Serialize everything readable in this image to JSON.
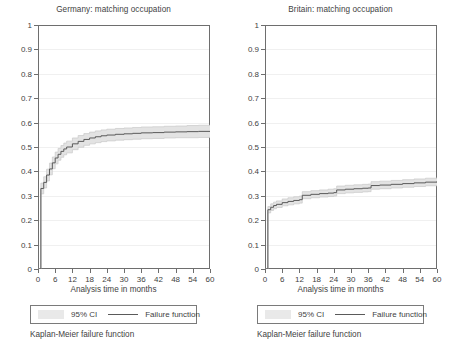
{
  "figure": {
    "panels": [
      {
        "title": "Germany: matching occupation",
        "xlabel": "Analysis time in months",
        "legend": {
          "ci_label": "95% CI",
          "line_label": "Failure function"
        },
        "note": "Kaplan-Meier failure function"
      },
      {
        "title": "Britain: matching occupation",
        "xlabel": "Analysis time in months",
        "legend": {
          "ci_label": "95% CI",
          "line_label": "Failure function"
        },
        "note": "Kaplan-Meier failure function"
      }
    ],
    "yticks": [
      "0",
      "0.1",
      "0.2",
      "0.3",
      "0.4",
      "0.5",
      "0.6",
      "0.7",
      "0.8",
      "0.9",
      "1"
    ],
    "xticks": [
      "0",
      "6",
      "12",
      "18",
      "24",
      "30",
      "36",
      "42",
      "48",
      "54",
      "60"
    ],
    "colors": {
      "line": "#5a5a5a",
      "ci_band": "#e3e3e3",
      "frame": "#6e6e6e",
      "grid": "#f0f0f0",
      "text": "#3f3f3f",
      "background": "#ffffff"
    }
  },
  "chart_data": [
    {
      "type": "line",
      "title": "Germany: matching occupation",
      "subtitle": "Kaplan-Meier failure function",
      "xlabel": "Analysis time in months",
      "ylabel": "",
      "xlim": [
        0,
        60
      ],
      "ylim": [
        0,
        1
      ],
      "xticks": [
        0,
        6,
        12,
        18,
        24,
        30,
        36,
        42,
        48,
        54,
        60
      ],
      "yticks": [
        0,
        0.1,
        0.2,
        0.3,
        0.4,
        0.5,
        0.6,
        0.7,
        0.8,
        0.9,
        1
      ],
      "grid": true,
      "legend": [
        "95% CI",
        "Failure function"
      ],
      "legend_position": "below-axes",
      "series": [
        {
          "name": "Failure function",
          "x": [
            0,
            1,
            1,
            2,
            3,
            4,
            5,
            6,
            7,
            8,
            9,
            10,
            12,
            14,
            16,
            18,
            20,
            22,
            24,
            27,
            30,
            33,
            36,
            40,
            44,
            48,
            52,
            56,
            60
          ],
          "values": [
            0,
            0,
            0.33,
            0.355,
            0.385,
            0.41,
            0.435,
            0.455,
            0.47,
            0.482,
            0.492,
            0.5,
            0.513,
            0.523,
            0.531,
            0.537,
            0.542,
            0.546,
            0.549,
            0.552,
            0.554,
            0.556,
            0.558,
            0.559,
            0.561,
            0.562,
            0.563,
            0.564,
            0.565
          ]
        },
        {
          "name": "95% CI upper",
          "x": [
            0,
            1,
            1,
            2,
            3,
            4,
            5,
            6,
            7,
            8,
            9,
            10,
            12,
            14,
            16,
            18,
            20,
            22,
            24,
            27,
            30,
            33,
            36,
            40,
            44,
            48,
            52,
            56,
            60
          ],
          "values": [
            0,
            0,
            0.352,
            0.378,
            0.409,
            0.434,
            0.459,
            0.479,
            0.494,
            0.506,
            0.516,
            0.524,
            0.537,
            0.547,
            0.555,
            0.561,
            0.566,
            0.57,
            0.573,
            0.576,
            0.578,
            0.58,
            0.582,
            0.583,
            0.585,
            0.586,
            0.588,
            0.589,
            0.59
          ]
        },
        {
          "name": "95% CI lower",
          "x": [
            0,
            1,
            1,
            2,
            3,
            4,
            5,
            6,
            7,
            8,
            9,
            10,
            12,
            14,
            16,
            18,
            20,
            22,
            24,
            27,
            30,
            33,
            36,
            40,
            44,
            48,
            52,
            56,
            60
          ],
          "values": [
            0,
            0,
            0.308,
            0.332,
            0.361,
            0.386,
            0.411,
            0.431,
            0.446,
            0.458,
            0.468,
            0.476,
            0.489,
            0.499,
            0.507,
            0.513,
            0.518,
            0.522,
            0.525,
            0.528,
            0.53,
            0.532,
            0.534,
            0.535,
            0.537,
            0.538,
            0.538,
            0.539,
            0.54
          ]
        }
      ]
    },
    {
      "type": "line",
      "title": "Britain: matching occupation",
      "subtitle": "Kaplan-Meier failure function",
      "xlabel": "Analysis time in months",
      "ylabel": "",
      "xlim": [
        0,
        60
      ],
      "ylim": [
        0,
        1
      ],
      "xticks": [
        0,
        6,
        12,
        18,
        24,
        30,
        36,
        42,
        48,
        54,
        60
      ],
      "yticks": [
        0,
        0.1,
        0.2,
        0.3,
        0.4,
        0.5,
        0.6,
        0.7,
        0.8,
        0.9,
        1
      ],
      "grid": true,
      "legend": [
        "95% CI",
        "Failure function"
      ],
      "legend_position": "below-axes",
      "series": [
        {
          "name": "Failure function",
          "x": [
            0,
            1,
            1,
            2,
            3,
            4,
            6,
            8,
            10,
            12,
            13,
            13,
            16,
            19,
            22,
            24,
            25,
            25,
            28,
            31,
            34,
            36,
            37,
            37,
            40,
            44,
            48,
            52,
            56,
            60
          ],
          "values": [
            0,
            0,
            0.243,
            0.253,
            0.26,
            0.265,
            0.272,
            0.277,
            0.281,
            0.284,
            0.285,
            0.302,
            0.306,
            0.309,
            0.311,
            0.313,
            0.314,
            0.324,
            0.327,
            0.329,
            0.331,
            0.332,
            0.333,
            0.342,
            0.344,
            0.347,
            0.35,
            0.353,
            0.356,
            0.359
          ]
        },
        {
          "name": "95% CI upper",
          "x": [
            0,
            1,
            1,
            2,
            3,
            4,
            6,
            8,
            10,
            12,
            13,
            13,
            16,
            19,
            22,
            24,
            25,
            25,
            28,
            31,
            34,
            36,
            37,
            37,
            40,
            44,
            48,
            52,
            56,
            60
          ],
          "values": [
            0,
            0,
            0.256,
            0.267,
            0.274,
            0.279,
            0.287,
            0.292,
            0.296,
            0.299,
            0.3,
            0.317,
            0.321,
            0.324,
            0.327,
            0.329,
            0.33,
            0.34,
            0.343,
            0.345,
            0.347,
            0.348,
            0.349,
            0.358,
            0.36,
            0.363,
            0.366,
            0.369,
            0.372,
            0.375
          ]
        },
        {
          "name": "95% CI lower",
          "x": [
            0,
            1,
            1,
            2,
            3,
            4,
            6,
            8,
            10,
            12,
            13,
            13,
            16,
            19,
            22,
            24,
            25,
            25,
            28,
            31,
            34,
            36,
            37,
            37,
            40,
            44,
            48,
            52,
            56,
            60
          ],
          "values": [
            0,
            0,
            0.23,
            0.24,
            0.247,
            0.252,
            0.259,
            0.263,
            0.267,
            0.27,
            0.271,
            0.288,
            0.292,
            0.295,
            0.297,
            0.299,
            0.3,
            0.309,
            0.312,
            0.314,
            0.316,
            0.317,
            0.318,
            0.327,
            0.329,
            0.332,
            0.335,
            0.338,
            0.341,
            0.344
          ]
        }
      ]
    }
  ]
}
